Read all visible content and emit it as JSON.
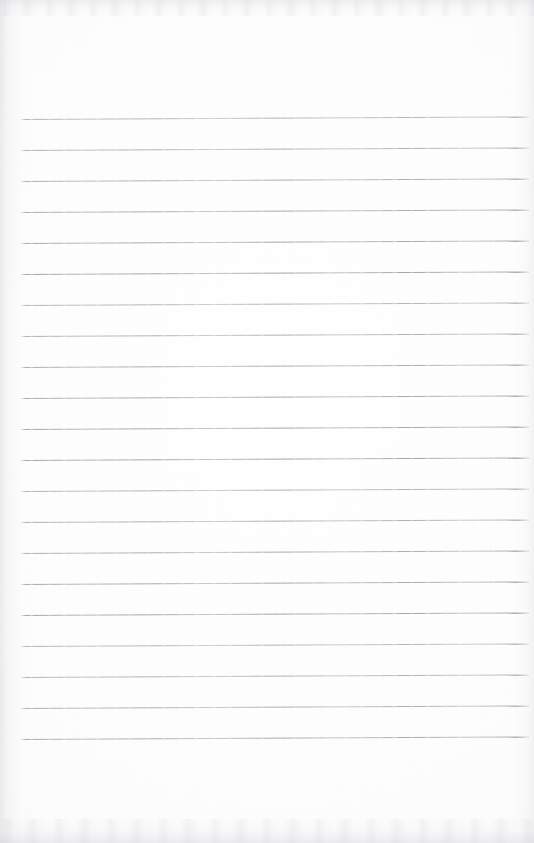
{
  "document": {
    "kind": "scanned-lined-notebook-page",
    "page_width": 534,
    "page_height": 843,
    "paper_color": "#fdfdfd",
    "content_text": "",
    "is_blank": true
  },
  "ruling": {
    "line_color": "#96969e",
    "line_thickness_px": 1,
    "line_count": 21,
    "left_x": 20,
    "right_x": 529,
    "first_line_y": 119,
    "line_spacing_px": 31,
    "last_line_y": 739,
    "slant_deg": -0.28,
    "top_margin_px": 119,
    "bottom_margin_px": 104,
    "lines_y": [
      119,
      150,
      181,
      212,
      243,
      274,
      305,
      336,
      367,
      398,
      429,
      460,
      491,
      522,
      553,
      584,
      615,
      646,
      677,
      708,
      739
    ]
  },
  "scan_artifacts": {
    "left_edge_shadow": "#a8a8b0",
    "top_edge_speckle": "#bebec6",
    "bottom_edge_speckle": "#bababe",
    "grain_opacity": 0.35
  }
}
